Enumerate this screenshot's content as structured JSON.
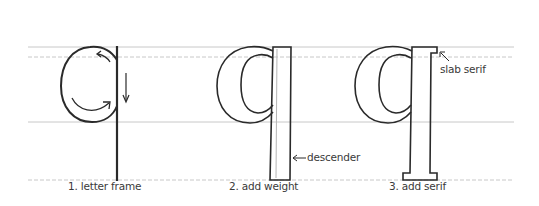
{
  "diagram": {
    "colors": {
      "background": "#ffffff",
      "ink": "#2a2a2a",
      "guideline": "#c8c8c8",
      "label": "#3a3a3a"
    },
    "guidelines": [
      {
        "name": "ascender-line",
        "y": 47,
        "style": "solid"
      },
      {
        "name": "x-height-line",
        "y": 57,
        "style": "dashed"
      },
      {
        "name": "baseline",
        "y": 122,
        "style": "solid"
      },
      {
        "name": "descender-line",
        "y": 180,
        "style": "dashed"
      }
    ],
    "steps": [
      {
        "number": 1,
        "caption": "1. letter frame"
      },
      {
        "number": 2,
        "caption": "2. add weight"
      },
      {
        "number": 3,
        "caption": "3. add serif"
      }
    ],
    "annotations": {
      "descender": "descender",
      "slab_serif": "slab serif"
    }
  }
}
